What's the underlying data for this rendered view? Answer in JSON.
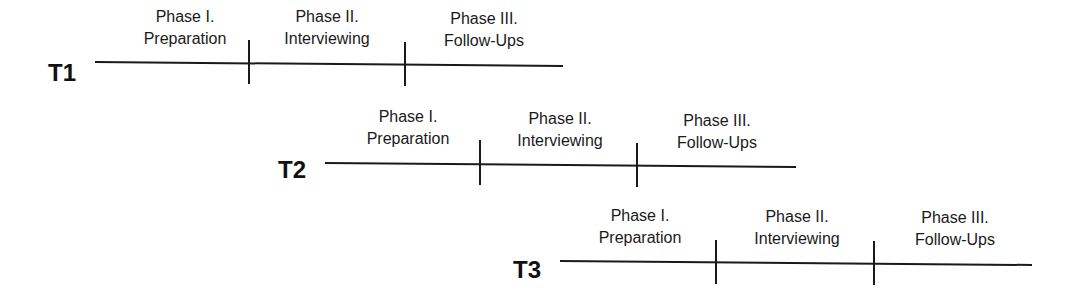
{
  "diagram": {
    "type": "staggered-timeline",
    "tracks": [
      {
        "label": "T1",
        "phases": [
          {
            "line1": "Phase I.",
            "line2": "Preparation"
          },
          {
            "line1": "Phase II.",
            "line2": "Interviewing"
          },
          {
            "line1": "Phase III.",
            "line2": "Follow-Ups"
          }
        ]
      },
      {
        "label": "T2",
        "phases": [
          {
            "line1": "Phase I.",
            "line2": "Preparation"
          },
          {
            "line1": "Phase II.",
            "line2": "Interviewing"
          },
          {
            "line1": "Phase III.",
            "line2": "Follow-Ups"
          }
        ]
      },
      {
        "label": "T3",
        "phases": [
          {
            "line1": "Phase I.",
            "line2": "Preparation"
          },
          {
            "line1": "Phase II.",
            "line2": "Interviewing"
          },
          {
            "line1": "Phase III.",
            "line2": "Follow-Ups"
          }
        ]
      }
    ],
    "colors": {
      "ink": "#1a1a1a",
      "background": "#ffffff"
    }
  }
}
